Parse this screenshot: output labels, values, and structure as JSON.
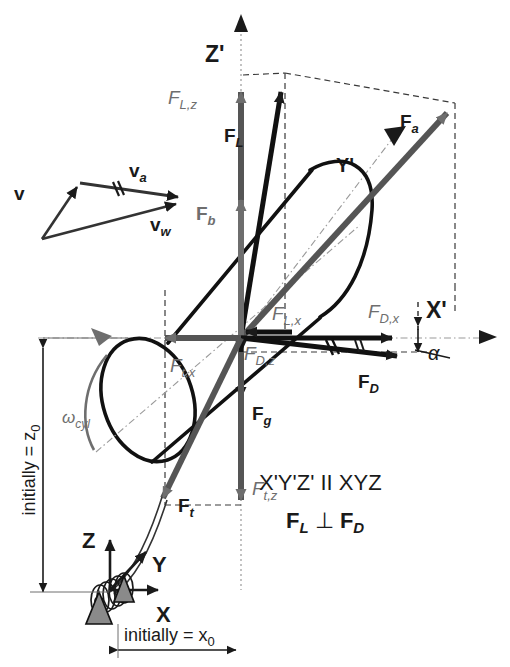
{
  "figure": {
    "type": "free-body-diagram",
    "background_color": "#ffffff",
    "ink_color": "#1a1a1a",
    "gray_color": "#6e6e6e",
    "width": 510,
    "height": 667
  },
  "axes": {
    "primed": {
      "origin_label": "",
      "x_label": "X'",
      "y_label": "Y'",
      "z_label": "Z'"
    },
    "unprimed": {
      "x_label": "X",
      "y_label": "Y",
      "z_label": "Z"
    }
  },
  "vectors": {
    "lift": {
      "label": "F",
      "sub": "L",
      "style": "black-bold"
    },
    "lift_z": {
      "label": "F",
      "sub": "L,z",
      "style": "gray-italic"
    },
    "lift_x": {
      "label": "F",
      "sub": "L,x",
      "style": "gray-italic"
    },
    "drag": {
      "label": "F",
      "sub": "D",
      "style": "black-bold"
    },
    "drag_x": {
      "label": "F",
      "sub": "D,x",
      "style": "gray-italic"
    },
    "drag_z": {
      "label": "F",
      "sub": "D,z",
      "style": "gray-italic"
    },
    "aero_resultant": {
      "label": "F",
      "sub": "a",
      "style": "gray-bold"
    },
    "buoyancy": {
      "label": "F",
      "sub": "b",
      "style": "gray-bold"
    },
    "gravity": {
      "label": "F",
      "sub": "g",
      "style": "black-bold"
    },
    "tether": {
      "label": "F",
      "sub": "t",
      "style": "black-bold"
    },
    "tether_x": {
      "label": "F",
      "sub": "t,x",
      "style": "gray-italic"
    },
    "tether_z": {
      "label": "F",
      "sub": "t,z",
      "style": "gray-italic"
    }
  },
  "velocity_triangle": {
    "v": {
      "label": "v",
      "sub": ""
    },
    "va": {
      "label": "v",
      "sub": "a"
    },
    "vw": {
      "label": "v",
      "sub": "w"
    },
    "tick_marks": "//"
  },
  "angles": {
    "alpha": {
      "symbol": "α"
    }
  },
  "rotation": {
    "omega_cyl": {
      "label": "ω",
      "sub": "cyl"
    }
  },
  "dimensions": {
    "z0": {
      "text": "initially = z",
      "sub": "0",
      "orientation": "vertical"
    },
    "x0": {
      "text": "initially = x",
      "sub": "0",
      "orientation": "horizontal"
    }
  },
  "notes": {
    "line1": "X'Y'Z' II XYZ",
    "line2_a": "F",
    "line2_a_sub": "L",
    "line2_perp": "⊥",
    "line2_b": "F",
    "line2_b_sub": "D"
  }
}
